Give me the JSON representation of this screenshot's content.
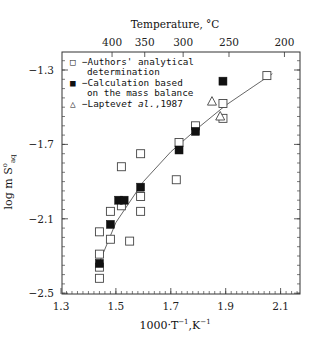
{
  "chart_data": {
    "type": "scatter",
    "title": "",
    "top_axis": {
      "label": "Temperature, °C",
      "ticks": [
        {
          "label": "400",
          "x_value": 1.486
        },
        {
          "label": "350",
          "x_value": 1.605
        },
        {
          "label": "300",
          "x_value": 1.745
        },
        {
          "label": "250",
          "x_value": 1.912
        },
        {
          "label": "200",
          "x_value": 2.114
        }
      ]
    },
    "xlabel": "1000·T⁻¹,K⁻¹",
    "ylabel": "log m S°aq",
    "xlim": [
      1.3,
      2.17
    ],
    "ylim": [
      -2.5,
      -1.2
    ],
    "x_ticks": [
      1.3,
      1.5,
      1.7,
      1.9,
      2.1
    ],
    "x_tick_labels": [
      "1.3",
      "1.5",
      "1.7",
      "1.9",
      "2.1"
    ],
    "y_ticks": [
      -1.3,
      -1.7,
      -2.1,
      -2.5
    ],
    "y_tick_labels": [
      "−1.3",
      "−1.7",
      "−2.1",
      "−2.5"
    ],
    "grid": false,
    "legend_position": "upper-left",
    "series": [
      {
        "name": "Authors' analytical determination",
        "marker": "open-square",
        "points": [
          [
            1.44,
            -2.42
          ],
          [
            1.44,
            -2.36
          ],
          [
            1.44,
            -2.29
          ],
          [
            1.44,
            -2.17
          ],
          [
            1.48,
            -2.21
          ],
          [
            1.48,
            -2.06
          ],
          [
            1.52,
            -2.03
          ],
          [
            1.52,
            -1.82
          ],
          [
            1.55,
            -2.22
          ],
          [
            1.59,
            -1.98
          ],
          [
            1.59,
            -2.06
          ],
          [
            1.59,
            -1.75
          ],
          [
            1.72,
            -1.89
          ],
          [
            1.73,
            -1.69
          ],
          [
            1.79,
            -1.6
          ],
          [
            1.89,
            -1.48
          ],
          [
            1.89,
            -1.56
          ],
          [
            2.05,
            -1.33
          ]
        ]
      },
      {
        "name": "Calculation based on the mass balance",
        "marker": "filled-square",
        "points": [
          [
            1.44,
            -2.34
          ],
          [
            1.48,
            -2.13
          ],
          [
            1.51,
            -2.0
          ],
          [
            1.53,
            -2.0
          ],
          [
            1.59,
            -1.93
          ],
          [
            1.73,
            -1.73
          ],
          [
            1.79,
            -1.63
          ],
          [
            1.89,
            -1.36
          ]
        ]
      },
      {
        "name": "Laptev et al.,1987",
        "marker": "open-triangle",
        "points": [
          [
            1.85,
            -1.47
          ],
          [
            1.88,
            -1.55
          ]
        ]
      },
      {
        "name": "fit",
        "type": "line",
        "points": [
          [
            1.43,
            -2.37
          ],
          [
            1.5,
            -2.12
          ],
          [
            1.6,
            -1.9
          ],
          [
            1.7,
            -1.74
          ],
          [
            1.8,
            -1.61
          ],
          [
            1.9,
            -1.49
          ],
          [
            2.0,
            -1.39
          ],
          [
            2.07,
            -1.32
          ]
        ]
      }
    ]
  },
  "labels": {
    "top_title": "Temperature, °C",
    "xlabel_main": "1000·T",
    "xlabel_sup1": "−1",
    "xlabel_mid": ",K",
    "xlabel_sup2": "−1",
    "ylabel_main": "log m S",
    "ylabel_sup": "o",
    "ylabel_sub": "aq"
  },
  "legend": {
    "row1_symbol": "□",
    "row1_line1": "−Authors' analytical",
    "row1_line2": "determination",
    "row2_symbol": "■",
    "row2_line1": "−Calculation based",
    "row2_line2": "on the mass balance",
    "row3_symbol": "△",
    "row3_prefix": "−Laptev ",
    "row3_italic": "et al.",
    "row3_suffix": ",1987"
  }
}
